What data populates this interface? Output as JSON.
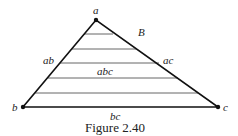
{
  "figure": {
    "caption": "Figure 2.40",
    "vertices": {
      "a": "a",
      "b": "b",
      "c": "c"
    },
    "edges": {
      "ab": "ab",
      "ac": "ac",
      "bc": "bc"
    },
    "region_label": "abc",
    "outside_label": "B",
    "hatch_lines": 5
  }
}
